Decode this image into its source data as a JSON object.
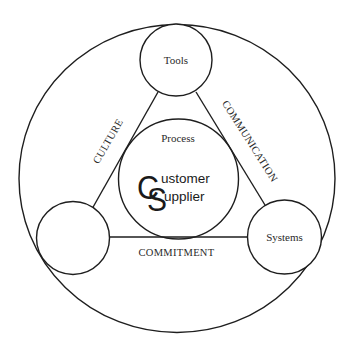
{
  "diagram": {
    "type": "concentric-triangle-model",
    "outer_circle": {
      "label": ""
    },
    "center": {
      "label": "Process",
      "logo": {
        "initial_1": "C",
        "rest_1": "ustomer",
        "initial_2": "S",
        "rest_2": "upplier",
        "full_text": "Customer Supplier"
      }
    },
    "nodes": [
      {
        "id": "top",
        "label": "Tools"
      },
      {
        "id": "bottom-left",
        "label": ""
      },
      {
        "id": "bottom-right",
        "label": "Systems"
      }
    ],
    "edges": [
      {
        "from": "top",
        "to": "bottom-left",
        "label": "CULTURE"
      },
      {
        "from": "top",
        "to": "bottom-right",
        "label": "COMMUNICATION"
      },
      {
        "from": "bottom-left",
        "to": "bottom-right",
        "label": "COMMITMENT"
      }
    ],
    "colors": {
      "stroke": "#1e1e1e",
      "text": "#2a2a2a",
      "background": "#ffffff"
    }
  }
}
